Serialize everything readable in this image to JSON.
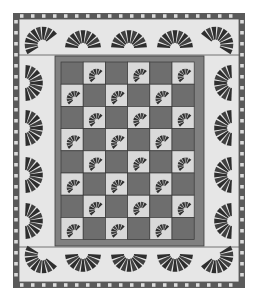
{
  "quilt": {
    "title": "Fan quilt pattern",
    "colors": {
      "page": "#ffffff",
      "background": "#e6e6e6",
      "checker_dark": "#5a5a5a",
      "checker_light": "#dcdcdc",
      "panel_dark": "#6e6e6e",
      "panel_frame": "#808080",
      "panel_line": "#3a3a3a",
      "cell_light": "#d9d9d9",
      "fan_dark": "#2e2e2e",
      "fan_light": "#9a9a9a",
      "band_line": "#555555"
    },
    "outer": {
      "x": 13,
      "y": 13,
      "w": 232,
      "h": 275,
      "checker_size": 5.5,
      "checker_thickness": 6
    },
    "inner_panel": {
      "x": 55,
      "y": 56,
      "w": 149,
      "h": 190,
      "frame": 6
    },
    "grid": {
      "rows": 8,
      "cols": 6,
      "x": 61,
      "y": 62,
      "cell": 22.2,
      "light_parity": 1
    },
    "border_fans": {
      "top": [
        {
          "cx": 38,
          "cy": 38,
          "rot": -35
        },
        {
          "cx": 83,
          "cy": 40,
          "rot": 0
        },
        {
          "cx": 129,
          "cy": 40,
          "rot": 0
        },
        {
          "cx": 175,
          "cy": 40,
          "rot": 0
        },
        {
          "cx": 220,
          "cy": 38,
          "rot": 35
        }
      ],
      "bottom": [
        {
          "cx": 38,
          "cy": 262,
          "rot": -145
        },
        {
          "cx": 83,
          "cy": 262,
          "rot": 180
        },
        {
          "cx": 129,
          "cy": 262,
          "rot": 180
        },
        {
          "cx": 175,
          "cy": 262,
          "rot": 180
        },
        {
          "cx": 220,
          "cy": 262,
          "rot": 145
        }
      ],
      "left": [
        {
          "cx": 33,
          "cy": 83,
          "rot": 90
        },
        {
          "cx": 33,
          "cy": 128,
          "rot": 90
        },
        {
          "cx": 33,
          "cy": 175,
          "rot": 90
        },
        {
          "cx": 33,
          "cy": 221,
          "rot": 90
        }
      ],
      "right": [
        {
          "cx": 224,
          "cy": 83,
          "rot": -90
        },
        {
          "cx": 224,
          "cy": 128,
          "rot": -90
        },
        {
          "cx": 224,
          "cy": 175,
          "rot": -90
        },
        {
          "cx": 224,
          "cy": 221,
          "rot": -90
        }
      ]
    },
    "fan_blades": 9
  }
}
